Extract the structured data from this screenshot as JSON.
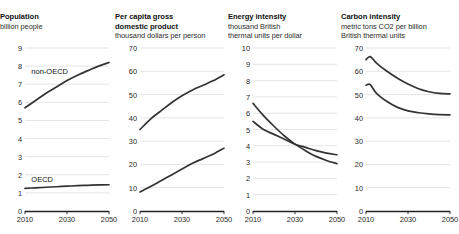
{
  "figure": {
    "background": "#ffffff",
    "line_color": "#333333",
    "grid_color": "#d2d2d2",
    "axis_color": "#222222"
  },
  "chart_data": [
    {
      "type": "line",
      "panel_index": 0,
      "title": "Population",
      "subtitle": "billion people",
      "xlabel": "",
      "ylabel": "",
      "xlim": [
        2010,
        2050
      ],
      "ylim": [
        0,
        9
      ],
      "yticks": [
        0,
        1,
        2,
        3,
        4,
        5,
        6,
        7,
        8,
        9
      ],
      "xticks": [
        2010,
        2030,
        2050
      ],
      "grid": true,
      "legend_position": "inline-annotation",
      "annotations": [
        {
          "text": "non-OECD",
          "x": 2013,
          "y": 7.75
        },
        {
          "text": "OECD",
          "x": 2013,
          "y": 1.75
        }
      ],
      "x": [
        2010,
        2015,
        2020,
        2025,
        2030,
        2035,
        2040,
        2045,
        2050
      ],
      "series": [
        {
          "name": "non-OECD",
          "values": [
            5.7,
            6.1,
            6.5,
            6.85,
            7.2,
            7.5,
            7.75,
            8.0,
            8.2
          ]
        },
        {
          "name": "OECD",
          "values": [
            1.25,
            1.28,
            1.31,
            1.34,
            1.37,
            1.4,
            1.42,
            1.44,
            1.45
          ]
        }
      ]
    },
    {
      "type": "line",
      "panel_index": 1,
      "title": "Per capita gross\ndomestic product",
      "subtitle": "thousand dollars per person",
      "xlabel": "",
      "ylabel": "",
      "xlim": [
        2010,
        2050
      ],
      "ylim": [
        0,
        70
      ],
      "yticks": [
        0,
        10,
        20,
        30,
        40,
        50,
        60,
        70
      ],
      "xticks": [
        2010,
        2030,
        2050
      ],
      "grid": true,
      "legend_position": "none",
      "annotations": [],
      "x": [
        2010,
        2015,
        2020,
        2025,
        2030,
        2035,
        2040,
        2045,
        2050
      ],
      "series": [
        {
          "name": "OECD",
          "values": [
            35.0,
            39.5,
            43.0,
            46.5,
            49.5,
            52.0,
            54.0,
            56.0,
            58.5
          ]
        },
        {
          "name": "non-OECD",
          "values": [
            8.2,
            10.5,
            13.0,
            15.5,
            18.0,
            20.5,
            22.5,
            24.5,
            27.0
          ]
        }
      ]
    },
    {
      "type": "line",
      "panel_index": 2,
      "title": "Energy intensity",
      "subtitle": "thousand British\nthermal units per dollar",
      "xlabel": "",
      "ylabel": "",
      "xlim": [
        2010,
        2050
      ],
      "ylim": [
        0,
        10
      ],
      "yticks": [
        0,
        1,
        2,
        3,
        4,
        5,
        6,
        7,
        8,
        9,
        10
      ],
      "xticks": [
        2010,
        2030,
        2050
      ],
      "grid": true,
      "legend_position": "none",
      "annotations": [],
      "x": [
        2010,
        2015,
        2020,
        2025,
        2030,
        2035,
        2040,
        2045,
        2050
      ],
      "series": [
        {
          "name": "non-OECD",
          "values": [
            6.6,
            5.85,
            5.2,
            4.6,
            4.1,
            3.7,
            3.35,
            3.1,
            2.9
          ]
        },
        {
          "name": "OECD",
          "values": [
            5.5,
            5.0,
            4.7,
            4.4,
            4.1,
            3.9,
            3.7,
            3.55,
            3.45
          ]
        }
      ]
    },
    {
      "type": "line",
      "panel_index": 3,
      "title": "Carbon intensity",
      "subtitle": "metric tons CO2 per billion\nBritish thermal units",
      "xlabel": "",
      "ylabel": "",
      "xlim": [
        2010,
        2050
      ],
      "ylim": [
        0,
        70
      ],
      "yticks": [
        0,
        10,
        20,
        30,
        40,
        50,
        60,
        70
      ],
      "xticks": [
        2010,
        2030,
        2050
      ],
      "grid": true,
      "legend_position": "none",
      "annotations": [],
      "x": [
        2010,
        2012,
        2015,
        2020,
        2025,
        2030,
        2035,
        2040,
        2045,
        2050
      ],
      "series": [
        {
          "name": "non-OECD",
          "values": [
            65.0,
            66.3,
            63.5,
            60.0,
            57.0,
            54.5,
            52.5,
            51.2,
            50.5,
            50.3
          ]
        },
        {
          "name": "OECD",
          "values": [
            54.0,
            54.3,
            50.5,
            47.0,
            44.5,
            43.0,
            42.2,
            41.7,
            41.4,
            41.3
          ]
        }
      ]
    }
  ]
}
